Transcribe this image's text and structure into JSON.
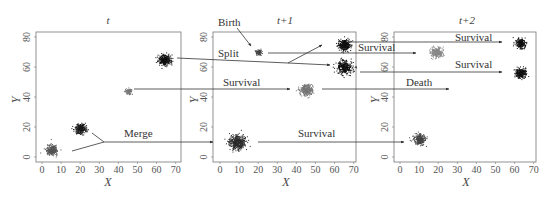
{
  "figure": {
    "panels": [
      {
        "id": "t",
        "title": "t",
        "frame": {
          "x1": 36,
          "y1": 32,
          "x2": 181,
          "y2": 162
        },
        "x0px": 42,
        "clusters": [
          {
            "x": 5,
            "y": 5,
            "r": 6,
            "color": "#555555",
            "density": 260
          },
          {
            "x": 20,
            "y": 19,
            "r": 6,
            "color": "#1a1a1a",
            "density": 260
          },
          {
            "x": 45,
            "y": 44,
            "r": 3.5,
            "color": "#777777",
            "density": 90
          },
          {
            "x": 64,
            "y": 65,
            "r": 6.5,
            "color": "#111111",
            "density": 320
          }
        ]
      },
      {
        "id": "t1",
        "title": "t+1",
        "frame": {
          "x1": 213,
          "y1": 32,
          "x2": 356,
          "y2": 162
        },
        "x0px": 220,
        "clusters": [
          {
            "x": 9,
            "y": 10,
            "r": 9,
            "color": "#2b2b2b",
            "density": 420
          },
          {
            "x": 20,
            "y": 70,
            "r": 3.5,
            "color": "#444444",
            "density": 80
          },
          {
            "x": 45,
            "y": 45,
            "r": 7,
            "color": "#777777",
            "density": 300
          },
          {
            "x": 65,
            "y": 75,
            "r": 7,
            "color": "#111111",
            "density": 300
          },
          {
            "x": 65,
            "y": 60,
            "r": 8,
            "color": "#111111",
            "density": 330
          }
        ]
      },
      {
        "id": "t2",
        "title": "t+2",
        "frame": {
          "x1": 394,
          "y1": 32,
          "x2": 536,
          "y2": 162
        },
        "x0px": 400,
        "clusters": [
          {
            "x": 10,
            "y": 12,
            "r": 6.5,
            "color": "#444444",
            "density": 260
          },
          {
            "x": 19,
            "y": 70,
            "r": 6.5,
            "color": "#888888",
            "density": 260
          },
          {
            "x": 63,
            "y": 76,
            "r": 5.5,
            "color": "#111111",
            "density": 240
          },
          {
            "x": 63,
            "y": 56,
            "r": 6,
            "color": "#111111",
            "density": 260
          }
        ]
      }
    ],
    "axes": {
      "xlabel": "X",
      "ylabel": "Y",
      "xticks": [
        "0",
        "10",
        "20",
        "30",
        "40",
        "50",
        "60",
        "70"
      ],
      "yticks": [
        "0",
        "20",
        "40",
        "60",
        "80"
      ],
      "px_per_x": 1.91,
      "px_per_y": 1.5,
      "y0px": 157
    },
    "annotations": {
      "merge": "Merge",
      "birth": "Birth",
      "split": "Split",
      "survival_p1_mid": "Survival",
      "survival_p1_bottom": "Survival",
      "survival_p2_split_top": "Survival",
      "survival_p3_top": "Survival",
      "survival_p3_mid": "Survival",
      "death": "Death"
    }
  }
}
